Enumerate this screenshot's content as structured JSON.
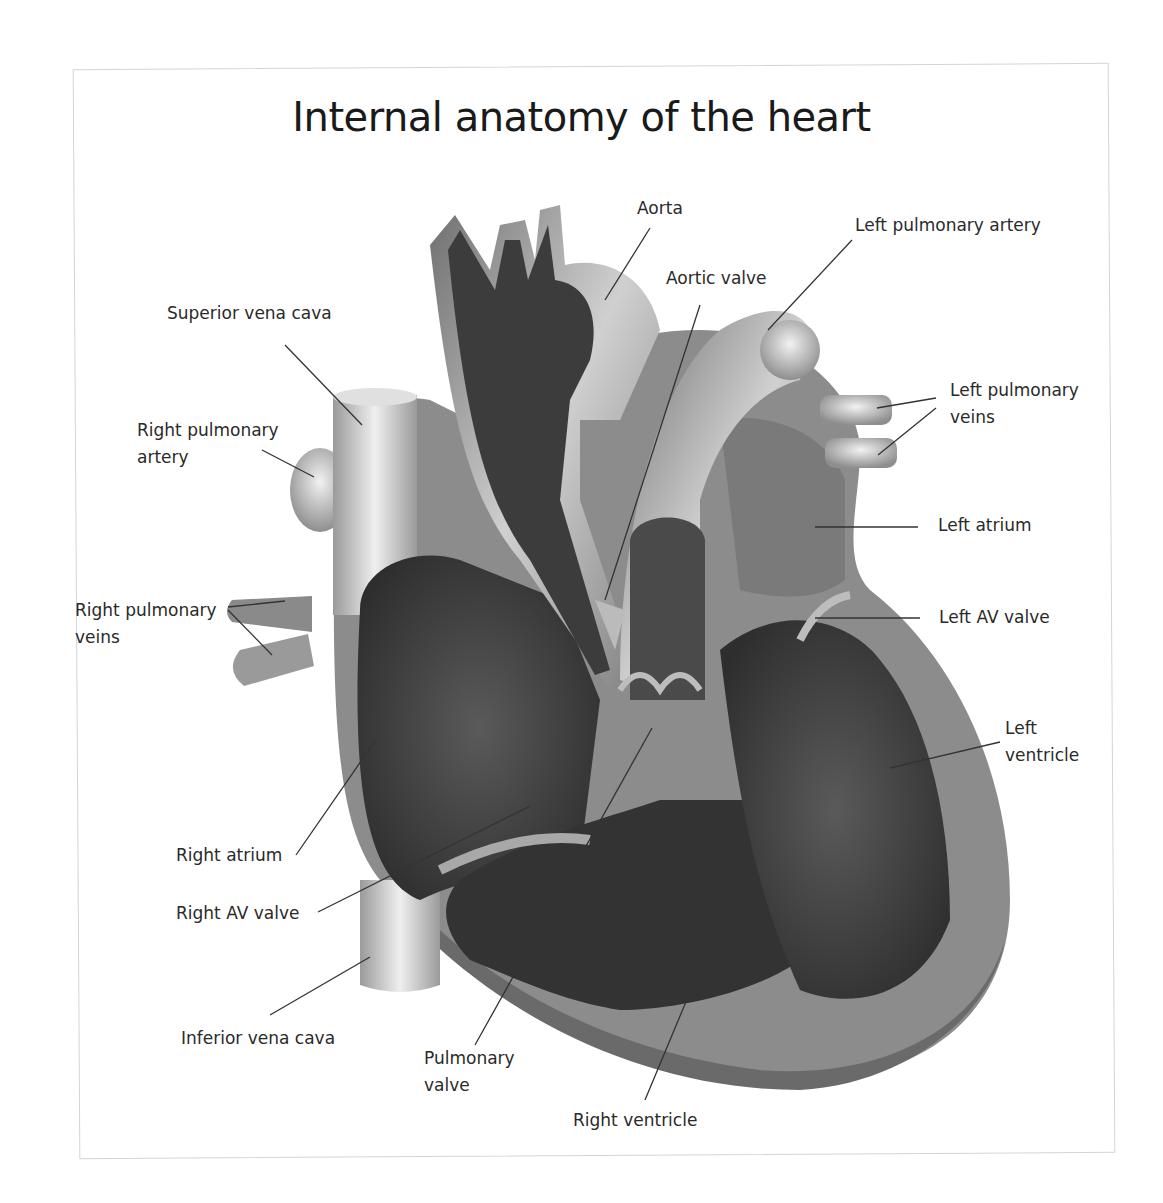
{
  "title": "Internal anatomy of the heart",
  "labels": {
    "aorta": "Aorta",
    "left_pulmonary_artery": "Left pulmonary artery",
    "aortic_valve": "Aortic valve",
    "superior_vena_cava": "Superior vena cava",
    "left_pulmonary_veins": "Left pulmonary\nveins",
    "right_pulmonary_artery": "Right pulmonary\nartery",
    "left_atrium": "Left atrium",
    "right_pulmonary_veins": "Right pulmonary\nveins",
    "left_av_valve": "Left AV valve",
    "left_ventricle": "Left\nventricle",
    "right_atrium": "Right atrium",
    "right_av_valve": "Right AV valve",
    "inferior_vena_cava": "Inferior vena cava",
    "pulmonary_valve": "Pulmonary\nvalve",
    "right_ventricle": "Right ventricle"
  },
  "colors": {
    "outer_wall": "#8a8a8a",
    "inner_chamber": "#3a3a3a",
    "vessel_light": "#d8d8d8",
    "leader_line": "#333333"
  }
}
